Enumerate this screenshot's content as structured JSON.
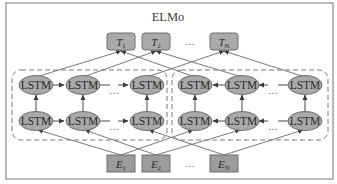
{
  "title": "ELMo",
  "outputs": [
    {
      "base": "T",
      "sub": "1"
    },
    {
      "base": "T",
      "sub": "2"
    },
    {
      "base": "T",
      "sub": "N"
    }
  ],
  "inputs": [
    {
      "base": "E",
      "sub": "1"
    },
    {
      "base": "E",
      "sub": "2"
    },
    {
      "base": "E",
      "sub": "N"
    }
  ],
  "ellipsis": "…",
  "lstm_label": "LSTM",
  "blocks": [
    {
      "name": "forward",
      "direction": "left-to-right",
      "rows": 2,
      "cells_per_row": 3
    },
    {
      "name": "backward",
      "direction": "right-to-left",
      "rows": 2,
      "cells_per_row": 3
    }
  ],
  "colors": {
    "node_fill": "#a9a9a9",
    "box_fill": "#aaaaaa",
    "input_fill": "#9c9c9c",
    "edge": "#6a6a6a"
  }
}
